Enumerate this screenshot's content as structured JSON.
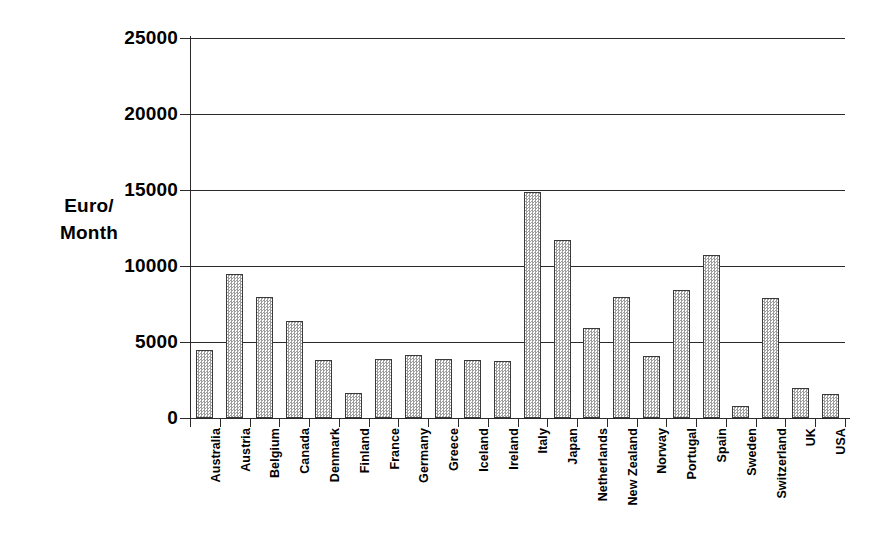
{
  "chart_data": {
    "type": "bar",
    "title": "",
    "subtitle": "",
    "xlabel": "",
    "ylabel": "Euro/\nMonth",
    "ylabel_lines": [
      "Euro/",
      "Month"
    ],
    "ylim": [
      0,
      25000
    ],
    "ytick_values": [
      0,
      5000,
      10000,
      15000,
      20000,
      25000
    ],
    "ytick_labels": [
      "0",
      "5000",
      "10000",
      "15000",
      "20000",
      "25000"
    ],
    "grid": "horizontal",
    "legend": "none",
    "bar_style": {
      "fill": "gray-stipple-pattern",
      "fill_color": "#9d9d9d",
      "background_color": "#ffffff",
      "border_color": "#3a3a3a"
    },
    "categories": [
      "Australia",
      "Austria",
      "Belgium",
      "Canada",
      "Denmark",
      "Finland",
      "France",
      "Germany",
      "Greece",
      "Iceland",
      "Ireland",
      "Italy",
      "Japan",
      "Netherlands",
      "New Zealand",
      "Norway",
      "Portugal",
      "Spain",
      "Sweden",
      "Switzerland",
      "UK",
      "USA"
    ],
    "values": [
      4500,
      9450,
      7950,
      6400,
      3800,
      1650,
      3900,
      4150,
      3850,
      3800,
      3750,
      14900,
      11700,
      5950,
      7950,
      4100,
      8450,
      10700,
      800,
      7900,
      2000,
      1600
    ]
  },
  "axes": {
    "y_axis_title": "Euro/\nMonth"
  }
}
